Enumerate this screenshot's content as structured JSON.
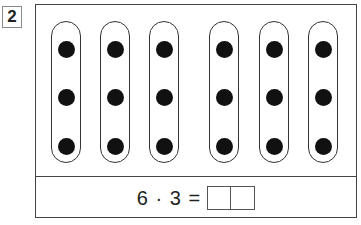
{
  "task": {
    "number": "2"
  },
  "groups": {
    "count": 6,
    "dots_per_group": 3,
    "oval_left_px": [
      15,
      64,
      113,
      173,
      223,
      272
    ],
    "dot_top_px": [
      19,
      67,
      116
    ]
  },
  "equation": {
    "text": "6 · 3 =",
    "answer_boxes": [
      "",
      ""
    ]
  }
}
